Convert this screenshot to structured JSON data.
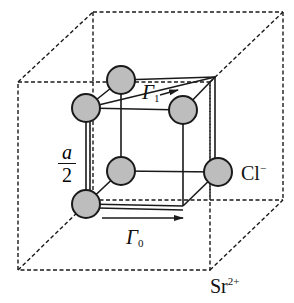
{
  "figure": {
    "type": "crystal-structure-diagram",
    "labels": {
      "lattice_half": {
        "numerator": "a",
        "denominator": "2"
      },
      "gamma1": {
        "symbol": "Γ",
        "subscript": "1"
      },
      "gamma0": {
        "symbol": "Γ",
        "subscript": "0"
      },
      "anion": {
        "base": "Cl",
        "charge": "−"
      },
      "cation": {
        "base": "Sr",
        "charge": "2+"
      }
    },
    "colors": {
      "atom_fill": "#bdbdbd",
      "line": "#1a1a1a",
      "background": "#ffffff"
    },
    "atoms": [
      {
        "id": "cl-top-back-left",
        "cx": 121,
        "cy": 80
      },
      {
        "id": "cl-top-front-left",
        "cx": 86,
        "cy": 108
      },
      {
        "id": "cl-top-front-right",
        "cx": 183,
        "cy": 110
      },
      {
        "id": "cl-bottom-back-left",
        "cx": 121,
        "cy": 171
      },
      {
        "id": "cl-bottom-front-right",
        "cx": 218,
        "cy": 172
      },
      {
        "id": "cl-bottom-front-left",
        "cx": 86,
        "cy": 204
      }
    ]
  }
}
